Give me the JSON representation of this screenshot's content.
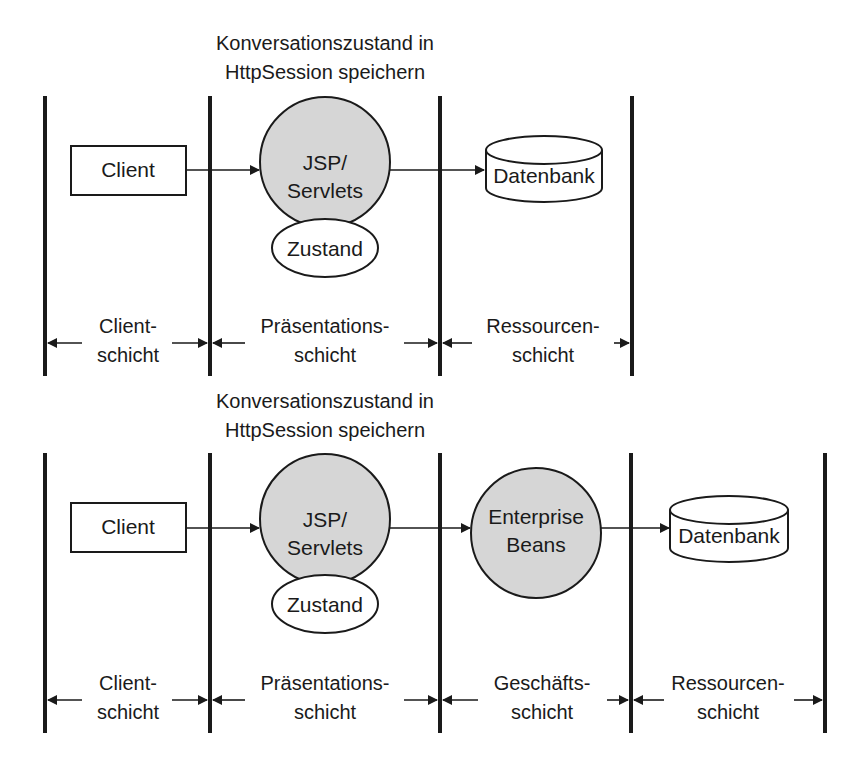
{
  "colors": {
    "ink": "#1a1a1a",
    "component_fill": "#d6d6d6",
    "background": "#ffffff"
  },
  "diagrams": [
    {
      "id": "three-tier",
      "title_line1": "Konversationszustand in",
      "title_line2": "HttpSession speichern",
      "nodes": {
        "client": "Client",
        "web_line1": "JSP/",
        "web_line2": "Servlets",
        "state": "Zustand",
        "database": "Datenbank"
      },
      "layers": [
        {
          "line1": "Client-",
          "line2": "schicht"
        },
        {
          "line1": "Präsentations-",
          "line2": "schicht"
        },
        {
          "line1": "Ressourcen-",
          "line2": "schicht"
        }
      ]
    },
    {
      "id": "four-tier",
      "title_line1": "Konversationszustand in",
      "title_line2": "HttpSession speichern",
      "nodes": {
        "client": "Client",
        "web_line1": "JSP/",
        "web_line2": "Servlets",
        "state": "Zustand",
        "ejb_line1": "Enterprise",
        "ejb_line2": "Beans",
        "database": "Datenbank"
      },
      "layers": [
        {
          "line1": "Client-",
          "line2": "schicht"
        },
        {
          "line1": "Präsentations-",
          "line2": "schicht"
        },
        {
          "line1": "Geschäfts-",
          "line2": "schicht"
        },
        {
          "line1": "Ressourcen-",
          "line2": "schicht"
        }
      ]
    }
  ]
}
